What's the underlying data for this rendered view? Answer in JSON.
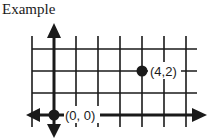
{
  "title": "Example",
  "points": [
    {
      "label": "(0, 0)",
      "x": 0,
      "y": 0
    },
    {
      "label": "(4,2)",
      "x": 4,
      "y": 2
    }
  ],
  "grid": {
    "x_lines": [
      -1,
      0,
      1,
      2,
      3,
      4,
      5,
      6
    ],
    "y_lines": [
      0,
      1,
      2,
      3
    ]
  },
  "colors": {
    "ink": "#1a1a1a",
    "background": "#ffffff"
  }
}
